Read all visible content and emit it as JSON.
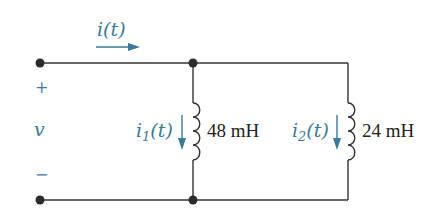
{
  "diagram": {
    "type": "circuit",
    "colors": {
      "wire": "#333333",
      "annotation": "#3b7b98",
      "label": "#222222"
    },
    "source": {
      "current_label": "i(t)",
      "current_var": "i",
      "current_arg": "(t)",
      "voltage_label": "v",
      "plus": "+",
      "minus": "−"
    },
    "inductors": [
      {
        "current_var": "i",
        "current_sub": "1",
        "current_arg": "(t)",
        "value_label": "48 mH"
      },
      {
        "current_var": "i",
        "current_sub": "2",
        "current_arg": "(t)",
        "value_label": "24 mH"
      }
    ]
  }
}
